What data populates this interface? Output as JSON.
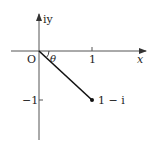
{
  "diagram": {
    "type": "complex-plane",
    "axes": {
      "x_label": "x",
      "y_label": "iy",
      "origin_label": "O"
    },
    "ticks": {
      "x_tick": "1",
      "y_tick": "−1"
    },
    "angle_label": "θ",
    "point": {
      "label": "1 − i",
      "re": 1,
      "im": -1
    },
    "colors": {
      "axis": "#555555",
      "segment": "#111111",
      "text": "#222222"
    }
  }
}
